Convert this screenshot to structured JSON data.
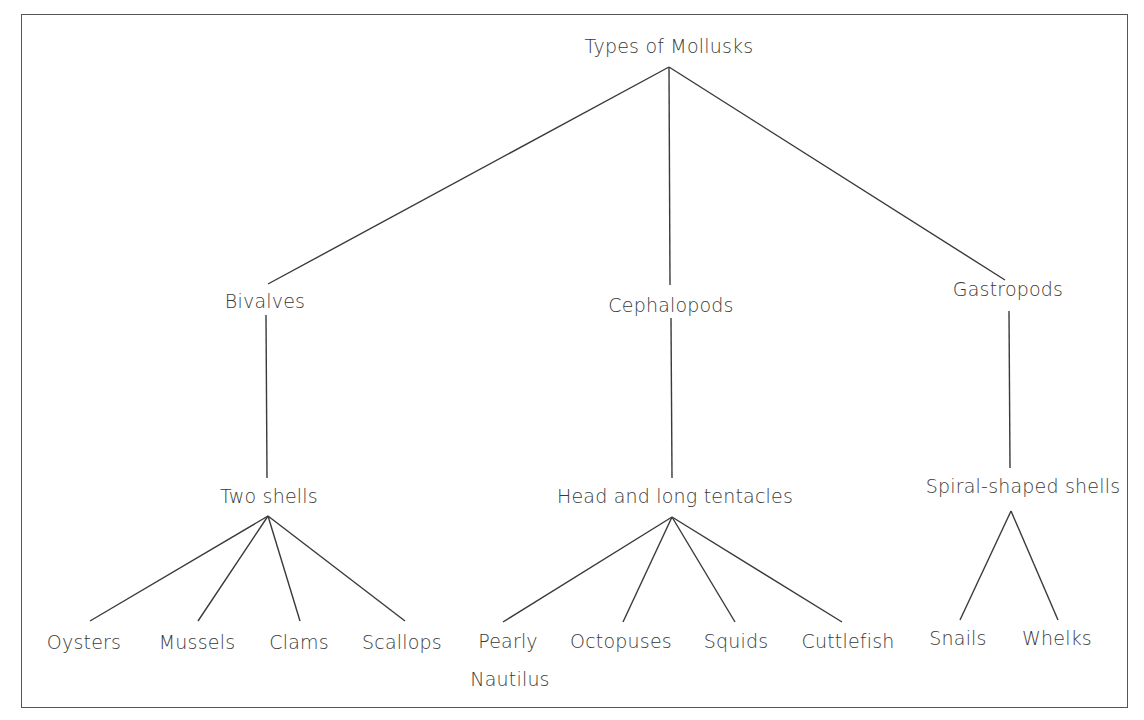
{
  "diagram": {
    "type": "tree",
    "root": {
      "label": "Types of Mollusks",
      "children": [
        {
          "label": "Bivalves",
          "trait": "Two shells",
          "examples": [
            "Oysters",
            "Mussels",
            "Clams",
            "Scallops"
          ]
        },
        {
          "label": "Cephalopods",
          "trait": "Head and long tentacles",
          "examples": [
            "Pearly Nautilus",
            "Octopuses",
            "Squids",
            "Cuttlefish"
          ]
        },
        {
          "label": "Gastropods",
          "trait": "Spiral-shaped shells",
          "examples": [
            "Snails",
            "Whelks"
          ]
        }
      ]
    }
  },
  "labels": {
    "root": "Types of Mollusks",
    "bivalves": "Bivalves",
    "cephalopods": "Cephalopods",
    "gastropods": "Gastropods",
    "bivalves_trait": "Two shells",
    "cephalopods_trait": "Head and long tentacles",
    "gastropods_trait": "Spiral-shaped shells",
    "oysters": "Oysters",
    "mussels": "Mussels",
    "clams": "Clams",
    "scallops": "Scallops",
    "pearly_line1": "Pearly",
    "pearly_line2": "Nautilus",
    "octopuses": "Octopuses",
    "squids": "Squids",
    "cuttlefish": "Cuttlefish",
    "snails": "Snails",
    "whelks": "Whelks"
  },
  "style": {
    "line_color": "#3a3a3a",
    "text_color": "#3a3a3a",
    "frame_color": "#555555",
    "background": "#ffffff"
  }
}
